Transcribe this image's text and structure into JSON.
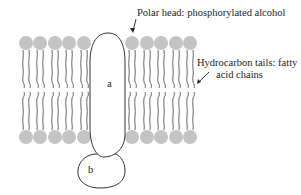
{
  "diagram": {
    "type": "lipid-bilayer-with-membrane-proteins",
    "annotations": {
      "polar_head": "Polar head: phosphorylated alcohol",
      "tails_line1": "Hydrocarbon tails: fatty",
      "tails_line2": "acid chains"
    },
    "proteins": {
      "a": "a",
      "b": "b"
    },
    "colors": {
      "head": "#c4c4c4",
      "tail": "#555555",
      "outline": "#333333",
      "text": "#222222"
    },
    "heads_left_x": [
      26,
      40,
      55,
      69,
      84
    ],
    "heads_right_x": [
      132,
      147,
      161,
      176,
      190
    ],
    "top_head_y": 43,
    "bottom_head_y": 137
  }
}
